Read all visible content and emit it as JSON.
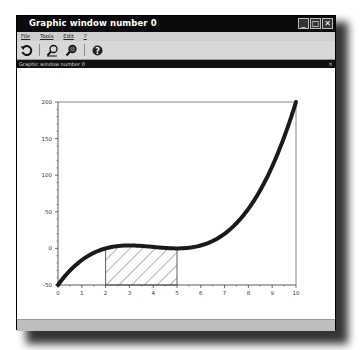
{
  "window": {
    "title": "Graphic window number 0",
    "subtitle": "Graphic window number 0",
    "controls": {
      "minimize": "_",
      "maximize": "□",
      "close": "✕"
    },
    "subclose": "×"
  },
  "menu": [
    {
      "label": "File"
    },
    {
      "label": "Tools"
    },
    {
      "label": "Edit"
    },
    {
      "label": "?"
    }
  ],
  "toolbar": [
    {
      "icon": "rotate-icon",
      "glyph": "⟲"
    },
    {
      "icon": "zoom-in-icon",
      "glyph": "⚲"
    },
    {
      "icon": "zoom-out-icon",
      "glyph": "⚲"
    },
    {
      "icon": "help-icon",
      "glyph": "?"
    }
  ],
  "chart_data": {
    "type": "line",
    "title": "",
    "xlabel": "",
    "ylabel": "",
    "xlim": [
      0,
      10
    ],
    "ylim": [
      -50,
      200
    ],
    "grid": false,
    "x_ticks": [
      "0",
      "1",
      "2",
      "3",
      "4",
      "5",
      "6",
      "7",
      "8",
      "9",
      "10"
    ],
    "y_ticks": [
      "-50",
      "0",
      "50",
      "100",
      "150",
      "200"
    ],
    "series": [
      {
        "name": "f(x) = (x-2)(x-5)^2",
        "x": [
          0,
          0.5,
          1,
          1.5,
          2,
          2.5,
          3,
          3.5,
          4,
          4.5,
          5,
          5.5,
          6,
          6.5,
          7,
          7.5,
          8,
          8.5,
          9,
          9.5,
          10
        ],
        "values": [
          -50,
          -30.375,
          -16,
          -6.125,
          0,
          3.125,
          4,
          3.375,
          2,
          0.625,
          0,
          0.875,
          4,
          10.125,
          20,
          34.375,
          54,
          79.625,
          112,
          152.375,
          200
        ]
      }
    ],
    "shaded_region": {
      "x_from": 2,
      "x_to": 5,
      "lower": -50,
      "upper": "curve",
      "fill": "hatch"
    }
  }
}
